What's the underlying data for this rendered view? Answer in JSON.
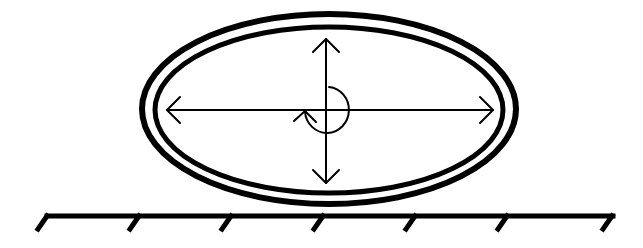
{
  "diagram": {
    "colors": {
      "stroke": "#000000",
      "background": "#ffffff"
    },
    "outer_ellipse": {
      "cx": 329,
      "cy": 109,
      "rx": 187,
      "ry": 95,
      "stroke_width": 6
    },
    "inner_ellipse": {
      "cx": 329,
      "cy": 109,
      "rx": 174,
      "ry": 83,
      "stroke_width": 5
    },
    "horizontal_axis": {
      "x1": 167,
      "x2": 493,
      "y": 110,
      "arrows": "both"
    },
    "vertical_axis": {
      "x": 325,
      "y1": 39,
      "y2": 183,
      "arrows": "both"
    },
    "rotation_arrow": {
      "cx": 326,
      "cy": 110,
      "r": 23,
      "direction": "counterclockwise-open-left"
    },
    "ground": {
      "y": 220,
      "x1": 45,
      "x2": 613,
      "hatch_positions": [
        45,
        138,
        230,
        322,
        414,
        506,
        598
      ]
    }
  }
}
